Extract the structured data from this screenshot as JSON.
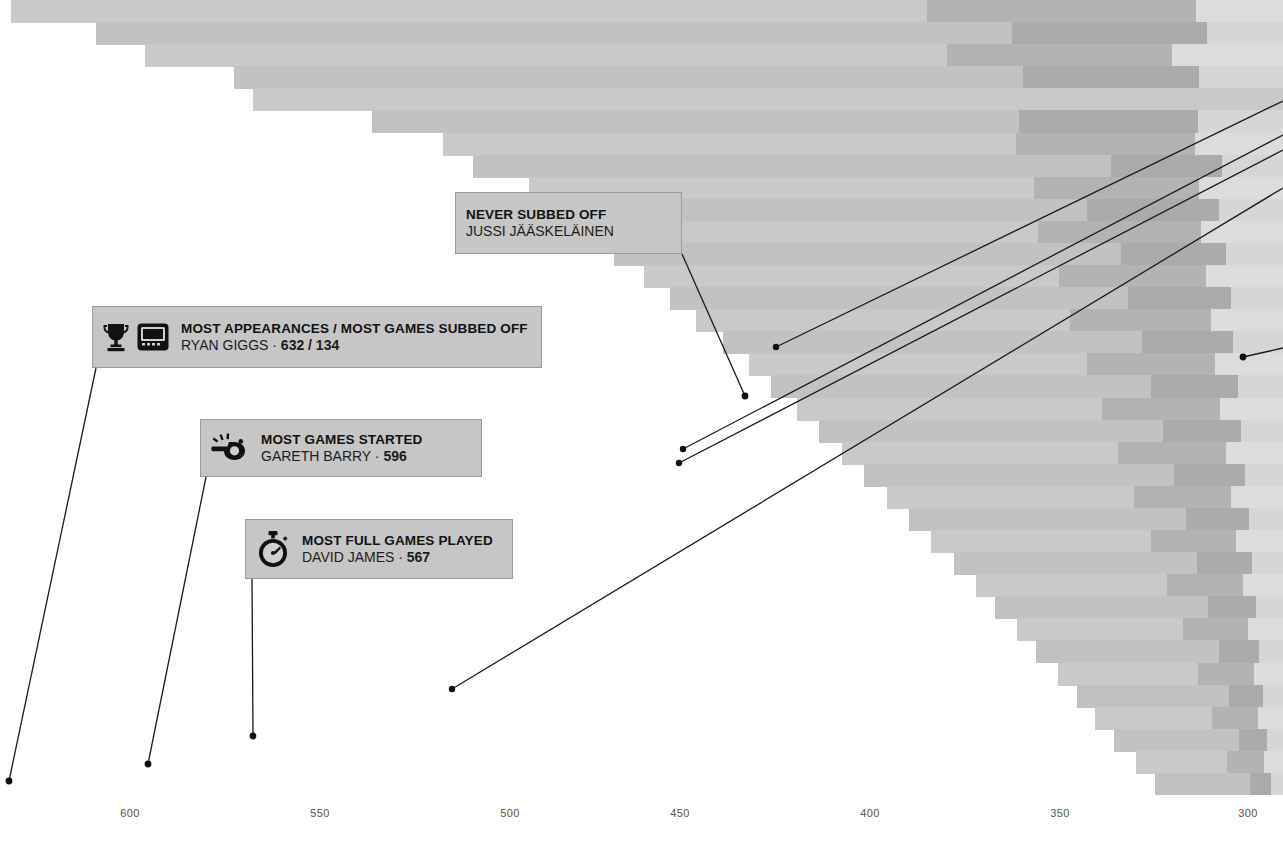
{
  "chart_data": {
    "type": "bar",
    "orientation": "horizontal",
    "xlabel": "",
    "ylabel": "",
    "grid": false,
    "legend_position": "none",
    "xlim": [
      600,
      290
    ],
    "x_axis_reversed": true,
    "tick_labels": [
      "600",
      "550",
      "500",
      "450",
      "400",
      "350",
      "300"
    ],
    "tick_values": [
      600,
      550,
      500,
      450,
      400,
      350,
      300
    ],
    "series": [
      {
        "name": "Full games played",
        "color": "#c9c9c9"
      },
      {
        "name": "Subbed off",
        "color": "#b3b3b3"
      },
      {
        "name": "Subbed on",
        "color": "#dcdcdc"
      }
    ],
    "bars": [
      {
        "total": 632,
        "full": 455,
        "off": 134,
        "on": 43
      },
      {
        "total": 609,
        "full": 470,
        "off": 100,
        "on": 39
      },
      {
        "total": 596,
        "full": 420,
        "off": 118,
        "on": 58
      },
      {
        "total": 572,
        "full": 430,
        "off": 96,
        "on": 46
      },
      {
        "total": 567,
        "full": 567,
        "off": 0,
        "on": 0
      },
      {
        "total": 535,
        "full": 380,
        "off": 105,
        "on": 50
      },
      {
        "total": 516,
        "full": 352,
        "off": 110,
        "on": 54
      },
      {
        "total": 508,
        "full": 400,
        "off": 70,
        "on": 38
      },
      {
        "total": 493,
        "full": 330,
        "off": 108,
        "on": 55
      },
      {
        "total": 486,
        "full": 355,
        "off": 88,
        "on": 43
      },
      {
        "total": 478,
        "full": 310,
        "off": 112,
        "on": 56
      },
      {
        "total": 470,
        "full": 356,
        "off": 74,
        "on": 40
      },
      {
        "total": 462,
        "full": 300,
        "off": 106,
        "on": 56
      },
      {
        "total": 455,
        "full": 340,
        "off": 76,
        "on": 39
      },
      {
        "total": 448,
        "full": 285,
        "off": 108,
        "on": 55
      },
      {
        "total": 441,
        "full": 330,
        "off": 72,
        "on": 39
      },
      {
        "total": 434,
        "full": 275,
        "off": 104,
        "on": 55
      },
      {
        "total": 428,
        "full": 318,
        "off": 72,
        "on": 38
      },
      {
        "total": 421,
        "full": 264,
        "off": 102,
        "on": 55
      },
      {
        "total": 415,
        "full": 308,
        "off": 69,
        "on": 38
      },
      {
        "total": 409,
        "full": 256,
        "off": 100,
        "on": 53
      },
      {
        "total": 403,
        "full": 298,
        "off": 68,
        "on": 37
      },
      {
        "total": 397,
        "full": 248,
        "off": 97,
        "on": 52
      },
      {
        "total": 391,
        "full": 290,
        "off": 65,
        "on": 36
      },
      {
        "total": 385,
        "full": 240,
        "off": 94,
        "on": 51
      },
      {
        "total": 379,
        "full": 280,
        "off": 63,
        "on": 36
      },
      {
        "total": 373,
        "full": 232,
        "off": 92,
        "on": 49
      },
      {
        "total": 368,
        "full": 272,
        "off": 61,
        "on": 35
      },
      {
        "total": 362,
        "full": 226,
        "off": 89,
        "on": 47
      },
      {
        "total": 357,
        "full": 264,
        "off": 59,
        "on": 34
      },
      {
        "total": 351,
        "full": 218,
        "off": 87,
        "on": 46
      },
      {
        "total": 346,
        "full": 256,
        "off": 57,
        "on": 33
      },
      {
        "total": 341,
        "full": 212,
        "off": 84,
        "on": 45
      },
      {
        "total": 336,
        "full": 249,
        "off": 55,
        "on": 32
      },
      {
        "total": 330,
        "full": 205,
        "off": 82,
        "on": 43
      },
      {
        "total": 325,
        "full": 241,
        "off": 53,
        "on": 31
      }
    ]
  },
  "axis": {
    "ticks": [
      {
        "label": "600",
        "x": 130
      },
      {
        "label": "550",
        "x": 320
      },
      {
        "label": "500",
        "x": 510
      },
      {
        "label": "450",
        "x": 680
      },
      {
        "label": "400",
        "x": 870
      },
      {
        "label": "350",
        "x": 1060
      },
      {
        "label": "300",
        "x": 1248
      }
    ]
  },
  "callouts": {
    "never_subbed_off": {
      "headline": "NEVER SUBBED OFF",
      "subline": "JUSSI JÄÄSKELÄINEN",
      "icons": []
    },
    "most_appearances": {
      "headline": "MOST APPEARANCES / MOST GAMES SUBBED OFF",
      "name": "RYAN GIGGS",
      "separator": "·",
      "value": "632 / 134",
      "icons": [
        "trophy-icon",
        "substitution-board-icon"
      ]
    },
    "most_games_started": {
      "headline": "MOST GAMES STARTED",
      "name": "GARETH BARRY",
      "separator": "·",
      "value": "596",
      "icons": [
        "whistle-icon"
      ]
    },
    "most_full_games": {
      "headline": "MOST FULL GAMES PLAYED",
      "name": "DAVID JAMES",
      "separator": "·",
      "value": "567",
      "icons": [
        "stopwatch-icon"
      ]
    }
  },
  "colors": {
    "callout_background": "#c6c6c6",
    "callout_border": "#9a9a9a",
    "leader_line": "#1a1a1a",
    "bar_full": "#c9c9c9",
    "bar_subbed_off": "#b3b3b3",
    "bar_subbed_on": "#dcdcdc",
    "page_background": "#ffffff",
    "tick_label": "#555555"
  }
}
